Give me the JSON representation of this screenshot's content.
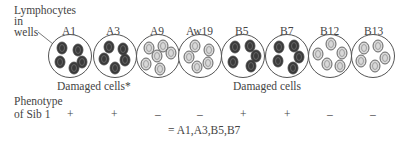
{
  "labels": {
    "lymphocytes_line1": "Lymphocytes",
    "lymphocytes_line2": "in",
    "lymphocytes_line3": "wells",
    "damaged_left": "Damaged cells*",
    "damaged_right": "Damaged cells",
    "phenotype_line1": "Phenotype",
    "phenotype_line2": "of Sib 1",
    "result": "= A1,A3,B5,B7"
  },
  "wells": [
    {
      "antigen": "A1",
      "damaged": true,
      "sign": "+"
    },
    {
      "antigen": "A3",
      "damaged": true,
      "sign": "+"
    },
    {
      "antigen": "A9",
      "damaged": false,
      "sign": "–"
    },
    {
      "antigen": "Aw19",
      "damaged": false,
      "sign": "–"
    },
    {
      "antigen": "B5",
      "damaged": true,
      "sign": "+"
    },
    {
      "antigen": "B7",
      "damaged": true,
      "sign": "+"
    },
    {
      "antigen": "B12",
      "damaged": false,
      "sign": "–"
    },
    {
      "antigen": "B13",
      "damaged": false,
      "sign": "–"
    }
  ],
  "colors": {
    "damaged": "#3a3a3a",
    "healthy": "#d8d8d8",
    "outline": "#555555"
  }
}
